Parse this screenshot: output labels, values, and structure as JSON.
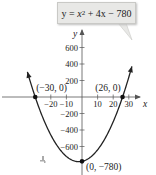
{
  "chart_data": {
    "type": "line",
    "equation": {
      "prefix": "y = ",
      "var": "x",
      "exp": "2",
      "rest": " + 4x − 780"
    },
    "xlabel": "x",
    "ylabel": "y",
    "xlim": [
      -40,
      36
    ],
    "ylim": [
      -900,
      800
    ],
    "x_ticks": [
      -20,
      -10,
      10,
      20,
      30
    ],
    "x_tick_labels": [
      "−20",
      "−10",
      "10",
      "20",
      "30"
    ],
    "y_ticks": [
      600,
      400,
      200,
      -200,
      -400,
      -600
    ],
    "y_tick_labels": [
      "600",
      "400",
      "200",
      "−200",
      "−400",
      "−600"
    ],
    "grid": false,
    "series": [
      {
        "name": "y = x^2 + 4x - 780",
        "function": "x^2 + 4x - 780",
        "x_range": [
          -35,
          32
        ]
      }
    ],
    "points": [
      {
        "x": -30,
        "y": 0,
        "label": "(−30, 0)"
      },
      {
        "x": 26,
        "y": 0,
        "label": "(26, 0)"
      },
      {
        "x": 0,
        "y": -780,
        "label": "(0, −780)"
      }
    ],
    "annotations": [
      "y = x² + 4x − 780"
    ]
  }
}
